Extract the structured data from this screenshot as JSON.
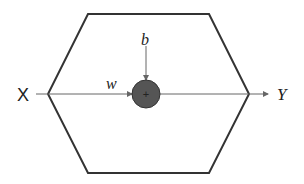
{
  "diagram": {
    "input_label": "X",
    "output_label": "Y",
    "weight_label": "w",
    "bias_label": "b",
    "node_symbol": "+",
    "equation": "Y = wX + b",
    "colors": {
      "stroke": "#333333",
      "arrow": "#666666",
      "node_fill": "#555555",
      "node_symbol": "#dddddd"
    }
  }
}
